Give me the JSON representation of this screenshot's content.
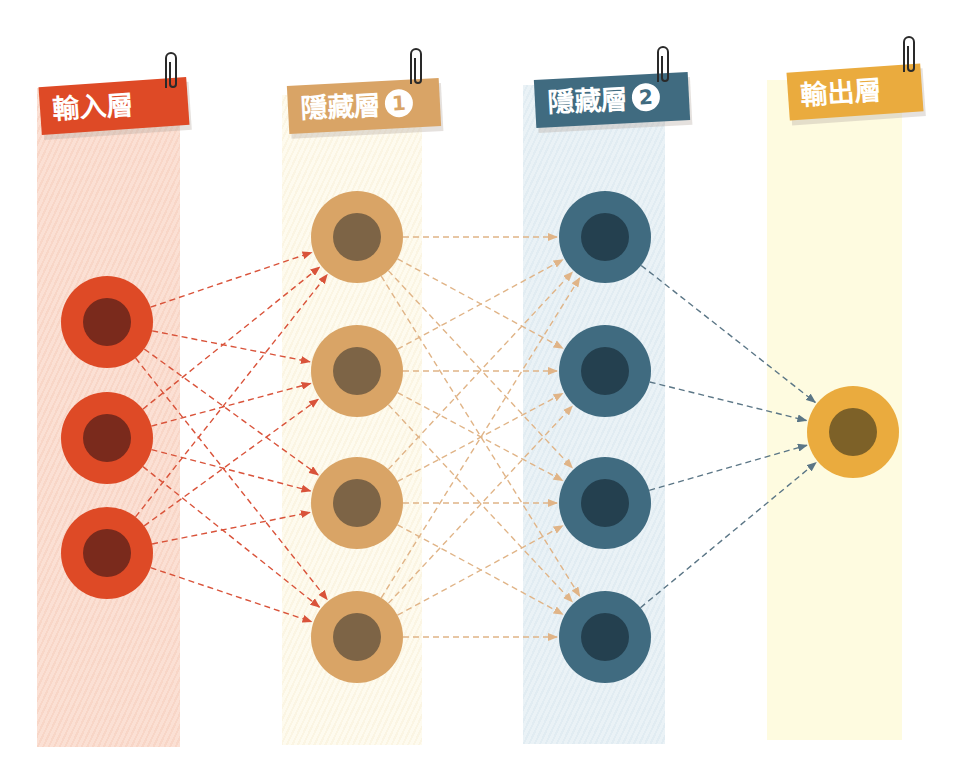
{
  "layers": [
    {
      "id": "input",
      "label": "輸入層",
      "badge": "",
      "node_count": 3,
      "color": "#de4a26",
      "inner_color": "#7a2a1c",
      "band_color": "#fbe0d4",
      "edge_color": "#d9533a"
    },
    {
      "id": "hidden1",
      "label": "隱藏層",
      "badge": "1",
      "node_count": 4,
      "color": "#d9a466",
      "inner_color": "#7d6446",
      "band_color": "#fefbef",
      "edge_color": "#e0b487"
    },
    {
      "id": "hidden2",
      "label": "隱藏層",
      "badge": "2",
      "node_count": 4,
      "color": "#406b80",
      "inner_color": "#24404f",
      "band_color": "#eaf2f6",
      "edge_color": "#5b7686"
    },
    {
      "id": "output",
      "label": "輸出層",
      "badge": "",
      "node_count": 1,
      "color": "#eaab3e",
      "inner_color": "#7d6128",
      "band_color": "#fefbe0",
      "edge_color": "#5b7686"
    }
  ],
  "connections": "fully-connected",
  "edge_style": "dashed-arrow"
}
